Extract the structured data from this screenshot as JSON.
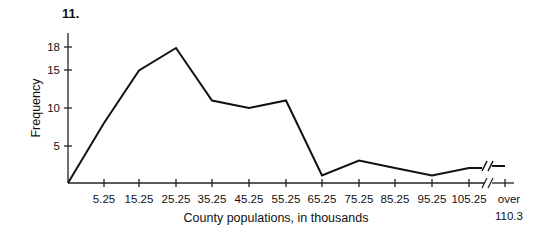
{
  "problem_number": "11.",
  "chart_data": {
    "type": "line",
    "title": "",
    "xlabel": "County populations, in thousands",
    "ylabel": "Frequency",
    "x": [
      "0",
      "5.25",
      "15.25",
      "25.25",
      "35.25",
      "45.25",
      "55.25",
      "65.25",
      "75.25",
      "85.25",
      "95.25",
      "105.25",
      "over 110.3"
    ],
    "series": [
      {
        "name": "Frequency polygon",
        "values": [
          0,
          8,
          15,
          18,
          11,
          10,
          11,
          1,
          3,
          2,
          1,
          2,
          2
        ]
      }
    ],
    "x_tick_labels": [
      "5.25",
      "15.25",
      "25.25",
      "35.25",
      "45.25",
      "55.25",
      "65.25",
      "75.25",
      "85.25",
      "95.25",
      "105.25",
      "over",
      "110.3"
    ],
    "y_ticks": [
      5,
      10,
      15,
      18
    ],
    "y_tick_labels": [
      "5",
      "10",
      "15",
      "18"
    ],
    "ylim": [
      0,
      20
    ],
    "grid": false,
    "legend": "none",
    "annotations": [
      "axis break (//) between 105.25 and over 110.3"
    ]
  }
}
